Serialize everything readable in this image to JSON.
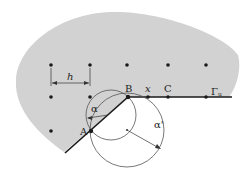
{
  "colors": {
    "domain_fill": "#d2d2d2",
    "ink": "#1a1a1a",
    "circle": "#555555",
    "background": "#ffffff"
  },
  "labels": {
    "h": "h",
    "alpha": "α",
    "alpha_prime": "α'",
    "A": "A",
    "B": "B",
    "x": "x",
    "C": "C",
    "gamma": "Γ",
    "gamma_sub": "u"
  },
  "grid_points": [
    {
      "x": 51,
      "y": 65
    },
    {
      "x": 90,
      "y": 65
    },
    {
      "x": 127,
      "y": 65
    },
    {
      "x": 168,
      "y": 65
    },
    {
      "x": 206,
      "y": 65
    },
    {
      "x": 51,
      "y": 97
    },
    {
      "x": 90,
      "y": 97
    },
    {
      "x": 51,
      "y": 131
    }
  ],
  "special_points": {
    "A": {
      "x": 91,
      "y": 131
    },
    "B": {
      "x": 128,
      "y": 97
    },
    "x": {
      "x": 148,
      "y": 97
    },
    "C": {
      "x": 168,
      "y": 97
    },
    "Gamma_u": {
      "x": 206,
      "y": 97
    }
  },
  "circles": {
    "small": {
      "cx": 111,
      "cy": 115,
      "r": 25
    },
    "large": {
      "cx": 127,
      "cy": 130,
      "r": 37
    }
  }
}
